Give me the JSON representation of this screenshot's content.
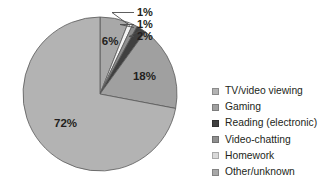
{
  "chart_data": {
    "type": "pie",
    "title": "",
    "subtitle": "",
    "xlabel": "",
    "ylabel": "",
    "grid": false,
    "legend_position": "right",
    "start_angle_deg": 0,
    "direction": "clockwise",
    "categories": [
      "TV/video viewing",
      "Gaming",
      "Reading (electronic)",
      "Video-chatting",
      "Homework",
      "Other/unknown"
    ],
    "values": [
      72,
      18,
      2,
      1,
      1,
      6
    ],
    "labels": [
      "72%",
      "18%",
      "2%",
      "1%",
      "1%",
      "6%"
    ],
    "units": "percent",
    "total": 100,
    "slices": [
      {
        "name": "TV/video viewing",
        "value": 72,
        "label": "72%",
        "color": "#b3b3b3",
        "label_placement": "inside",
        "has_leader": false
      },
      {
        "name": "Gaming",
        "value": 18,
        "label": "18%",
        "color": "#a0a0a0",
        "label_placement": "inside",
        "has_leader": false
      },
      {
        "name": "Reading (electronic)",
        "value": 2,
        "label": "2%",
        "color": "#404040",
        "label_placement": "outside",
        "has_leader": true
      },
      {
        "name": "Video-chatting",
        "value": 1,
        "label": "1%",
        "color": "#8f8f8f",
        "label_placement": "outside",
        "has_leader": true
      },
      {
        "name": "Homework",
        "value": 1,
        "label": "1%",
        "color": "#f2f2f2",
        "label_placement": "outside",
        "has_leader": true
      },
      {
        "name": "Other/unknown",
        "value": 6,
        "label": "6%",
        "color": "#a8a8a8",
        "label_placement": "inside",
        "has_leader": false
      }
    ]
  },
  "legend": {
    "items": [
      {
        "label": "TV/video viewing",
        "color": "#b3b3b3"
      },
      {
        "label": "Gaming",
        "color": "#a0a0a0"
      },
      {
        "label": "Reading (electronic)",
        "color": "#404040"
      },
      {
        "label": "Video-chatting",
        "color": "#8f8f8f"
      },
      {
        "label": "Homework",
        "color": "#d9d9d9"
      },
      {
        "label": "Other/unknown",
        "color": "#a8a8a8"
      }
    ]
  },
  "colors": {
    "background": "#ffffff",
    "text": "#231f20",
    "outline": "#595959",
    "leader_line": "#4d4d4d"
  }
}
